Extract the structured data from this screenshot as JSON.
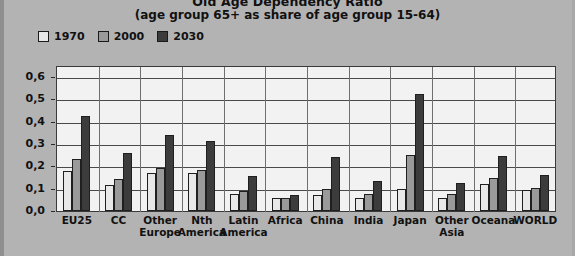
{
  "chart_data": {
    "type": "bar",
    "title": "Old Age Dependency Ratio",
    "subtitle": "(age group 65+ as share of age group 15-64)",
    "xlabel": "",
    "ylabel": "",
    "ylim": [
      0,
      0.65
    ],
    "grid": true,
    "legend_position": "top-left",
    "ytick_labels": [
      "0,6",
      "0,5",
      "0,4",
      "0,3",
      "0,2",
      "0,1",
      "0,0"
    ],
    "ytick_values": [
      0.6,
      0.5,
      0.4,
      0.3,
      0.2,
      0.1,
      0.0
    ],
    "categories": [
      "EU25",
      "CC",
      "Other Europe",
      "Nth America",
      "Latin America",
      "Africa",
      "China",
      "India",
      "Japan",
      "Other Asia",
      "Oceana",
      "WORLD"
    ],
    "category_lines": [
      [
        "EU25"
      ],
      [
        "CC"
      ],
      [
        "Other",
        "Europe"
      ],
      [
        "Nth",
        "America"
      ],
      [
        "Latin",
        "America"
      ],
      [
        "Africa"
      ],
      [
        "China"
      ],
      [
        "India"
      ],
      [
        "Japan"
      ],
      [
        "Other",
        "Asia"
      ],
      [
        "Oceana"
      ],
      [
        "WORLD"
      ]
    ],
    "series": [
      {
        "name": "1970",
        "color": "#e8e8e8",
        "values": [
          0.18,
          0.115,
          0.17,
          0.17,
          0.075,
          0.06,
          0.07,
          0.06,
          0.1,
          0.06,
          0.12,
          0.095
        ]
      },
      {
        "name": "2000",
        "color": "#9a9a9a",
        "values": [
          0.235,
          0.145,
          0.195,
          0.185,
          0.09,
          0.06,
          0.1,
          0.075,
          0.25,
          0.075,
          0.15,
          0.105
        ]
      },
      {
        "name": "2030",
        "color": "#3c3c3c",
        "values": [
          0.425,
          0.26,
          0.34,
          0.315,
          0.155,
          0.07,
          0.24,
          0.135,
          0.525,
          0.125,
          0.245,
          0.16
        ]
      }
    ]
  },
  "legend": {
    "items": [
      {
        "label": "1970",
        "color": "#e8e8e8"
      },
      {
        "label": "2000",
        "color": "#9a9a9a"
      },
      {
        "label": "2030",
        "color": "#3c3c3c"
      }
    ]
  },
  "colors": {
    "background": "#b3b3b3",
    "plot_background": "#f2f2f2",
    "gridline": "#4a4a4a",
    "axis": "#3a3a3a",
    "text": "#111111"
  }
}
